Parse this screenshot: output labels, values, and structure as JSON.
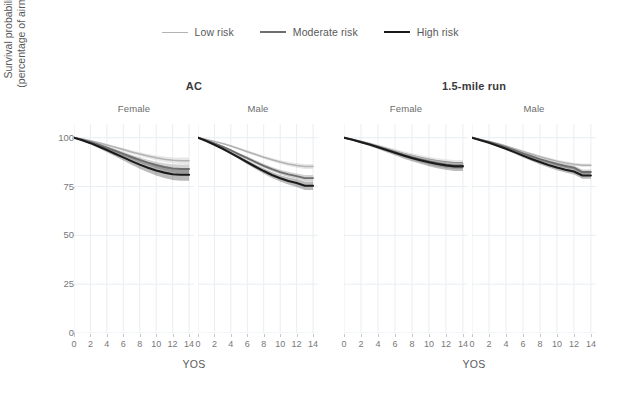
{
  "legend": {
    "position": "top-center",
    "items": [
      {
        "label": "Low risk",
        "color": "#b3b3b3",
        "width": 1.6
      },
      {
        "label": "Moderate risk",
        "color": "#6e6e6e",
        "width": 2.0
      },
      {
        "label": "High risk",
        "color": "#1a1a1a",
        "width": 2.2
      }
    ]
  },
  "axes": {
    "ylabel_line1": "Survival probability",
    "ylabel_line2": "(percentage of airmen)",
    "xlabel": "YOS",
    "yticks": [
      0,
      25,
      50,
      75,
      100
    ],
    "xticks": [
      0,
      2,
      4,
      6,
      8,
      10,
      12,
      14
    ],
    "ylim": [
      0,
      107
    ],
    "xlim": [
      0,
      14.6
    ],
    "grid": true,
    "grid_color": "#e9eef2"
  },
  "groups": {
    "super_titles": [
      "AC",
      "1.5-mile run"
    ],
    "facet_labels": [
      "Female",
      "Male",
      "Female",
      "Male"
    ]
  },
  "chart_data": {
    "type": "line",
    "title": "",
    "xlabel": "YOS",
    "ylabel": "Survival probability (percentage of airmen)",
    "xlim": [
      0,
      14.6
    ],
    "ylim": [
      0,
      107
    ],
    "xticks": [
      0,
      2,
      4,
      6,
      8,
      10,
      12,
      14
    ],
    "yticks": [
      0,
      25,
      50,
      75,
      100
    ],
    "grid": true,
    "legend_position": "top-center",
    "x": [
      0,
      1,
      2,
      3,
      4,
      5,
      6,
      7,
      8,
      9,
      10,
      11,
      12,
      13,
      14
    ],
    "panels": [
      {
        "super_title": "AC",
        "facet_label": "Female",
        "series": [
          {
            "name": "Low risk",
            "color": "#b3b3b3",
            "values": [
              100,
              99.3,
              98.4,
              97.4,
              96.3,
              95.1,
              93.9,
              92.7,
              91.6,
              90.6,
              89.7,
              89.0,
              88.4,
              88.2,
              88.2
            ],
            "ci_lower": [
              100,
              99.0,
              98.0,
              96.9,
              95.7,
              94.4,
              93.1,
              91.8,
              90.6,
              89.5,
              88.5,
              87.6,
              86.9,
              86.5,
              86.5
            ],
            "ci_upper": [
              100,
              99.6,
              98.8,
              97.9,
              96.9,
              95.8,
              94.7,
              93.6,
              92.6,
              91.7,
              90.9,
              90.4,
              89.9,
              89.9,
              89.9
            ]
          },
          {
            "name": "Moderate risk",
            "color": "#6e6e6e",
            "values": [
              100,
              99.0,
              97.8,
              96.4,
              94.9,
              93.3,
              91.7,
              90.1,
              88.6,
              87.2,
              86.0,
              85.0,
              84.3,
              84.0,
              84.0
            ],
            "ci_lower": [
              100,
              98.7,
              97.3,
              95.7,
              94.1,
              92.4,
              90.6,
              88.9,
              87.2,
              85.7,
              84.3,
              83.1,
              82.2,
              81.7,
              81.7
            ],
            "ci_upper": [
              100,
              99.3,
              98.3,
              97.1,
              95.7,
              94.2,
              92.8,
              91.3,
              90.0,
              88.7,
              87.7,
              86.9,
              86.4,
              86.3,
              86.3
            ]
          },
          {
            "name": "High risk",
            "color": "#1a1a1a",
            "values": [
              100,
              98.7,
              97.2,
              95.5,
              93.7,
              91.8,
              89.9,
              88.0,
              86.2,
              84.6,
              83.2,
              82.1,
              81.3,
              81.0,
              81.0
            ],
            "ci_lower": [
              100,
              98.3,
              96.6,
              94.6,
              92.6,
              90.5,
              88.3,
              86.2,
              84.1,
              82.3,
              80.6,
              79.3,
              78.3,
              77.9,
              77.9
            ],
            "ci_upper": [
              100,
              99.1,
              97.8,
              96.4,
              94.8,
              93.1,
              91.5,
              89.8,
              88.3,
              86.9,
              85.8,
              84.9,
              84.3,
              84.1,
              84.1
            ]
          }
        ]
      },
      {
        "super_title": "AC",
        "facet_label": "Male",
        "series": [
          {
            "name": "Low risk",
            "color": "#b3b3b3",
            "values": [
              100,
              99.1,
              98.1,
              97.0,
              95.7,
              94.3,
              92.8,
              91.4,
              90.0,
              88.7,
              87.5,
              86.5,
              85.7,
              85.2,
              85.2
            ],
            "ci_lower": [
              100,
              98.9,
              97.8,
              96.6,
              95.2,
              93.7,
              92.2,
              90.7,
              89.2,
              87.9,
              86.6,
              85.5,
              84.6,
              84.0,
              84.0
            ],
            "ci_upper": [
              100,
              99.3,
              98.4,
              97.4,
              96.2,
              94.9,
              93.5,
              92.1,
              90.8,
              89.6,
              88.5,
              87.6,
              86.9,
              86.5,
              86.5
            ]
          },
          {
            "name": "Moderate risk",
            "color": "#6e6e6e",
            "values": [
              100,
              98.6,
              97.1,
              95.4,
              93.5,
              91.5,
              89.5,
              87.5,
              85.6,
              83.9,
              82.4,
              81.2,
              80.3,
              79.3,
              79.3
            ],
            "ci_lower": [
              100,
              98.4,
              96.8,
              94.9,
              92.9,
              90.8,
              88.7,
              86.6,
              84.6,
              82.8,
              81.2,
              79.9,
              78.9,
              77.8,
              77.8
            ],
            "ci_upper": [
              100,
              98.9,
              97.5,
              95.9,
              94.1,
              92.2,
              90.3,
              88.4,
              86.6,
              85.0,
              83.6,
              82.5,
              81.7,
              80.9,
              80.9
            ]
          },
          {
            "name": "High risk",
            "color": "#1a1a1a",
            "values": [
              100,
              98.3,
              96.4,
              94.3,
              92.1,
              89.8,
              87.4,
              85.1,
              82.9,
              80.9,
              79.2,
              77.8,
              76.8,
              75.4,
              75.4
            ],
            "ci_lower": [
              100,
              98.0,
              96.0,
              93.8,
              91.4,
              88.9,
              86.4,
              83.9,
              81.5,
              79.4,
              77.5,
              76.0,
              74.8,
              73.2,
              73.2
            ],
            "ci_upper": [
              100,
              98.6,
              96.8,
              94.9,
              92.8,
              90.7,
              88.5,
              86.3,
              84.2,
              82.4,
              80.8,
              79.6,
              78.7,
              77.6,
              77.6
            ]
          }
        ]
      },
      {
        "super_title": "1.5-mile run",
        "facet_label": "Female",
        "series": [
          {
            "name": "Low risk",
            "color": "#b3b3b3",
            "values": [
              100,
              99.1,
              98.1,
              97.0,
              95.8,
              94.5,
              93.2,
              91.9,
              90.7,
              89.6,
              88.6,
              87.8,
              87.1,
              86.6,
              86.6
            ],
            "ci_lower": [
              100,
              98.8,
              97.7,
              96.4,
              95.0,
              93.6,
              92.1,
              90.7,
              89.3,
              88.1,
              87.0,
              86.1,
              85.3,
              84.7,
              84.7
            ],
            "ci_upper": [
              100,
              99.4,
              98.5,
              97.6,
              96.5,
              95.4,
              94.2,
              93.1,
              92.0,
              91.1,
              90.2,
              89.5,
              89.0,
              88.6,
              88.6
            ]
          },
          {
            "name": "Moderate risk",
            "color": "#6e6e6e",
            "values": [
              100,
              99.0,
              97.9,
              96.7,
              95.4,
              94.0,
              92.6,
              91.2,
              89.9,
              88.8,
              87.8,
              86.9,
              86.2,
              85.7,
              85.7
            ],
            "ci_lower": [
              100,
              98.7,
              97.5,
              96.2,
              94.7,
              93.2,
              91.6,
              90.1,
              88.7,
              87.4,
              86.3,
              85.3,
              84.5,
              83.9,
              83.9
            ],
            "ci_upper": [
              100,
              99.3,
              98.3,
              97.2,
              96.0,
              94.8,
              93.5,
              92.3,
              91.1,
              90.1,
              89.2,
              88.5,
              87.9,
              87.5,
              87.5
            ]
          },
          {
            "name": "High risk",
            "color": "#1a1a1a",
            "values": [
              100,
              98.9,
              97.7,
              96.5,
              95.1,
              93.7,
              92.3,
              90.9,
              89.6,
              88.4,
              87.4,
              86.5,
              85.8,
              85.3,
              85.3
            ],
            "ci_lower": [
              100,
              98.5,
              97.2,
              95.8,
              94.2,
              92.6,
              91.0,
              89.4,
              87.9,
              86.6,
              85.4,
              84.4,
              83.6,
              83.0,
              83.0
            ],
            "ci_upper": [
              100,
              99.2,
              98.2,
              97.1,
              95.9,
              94.7,
              93.5,
              92.3,
              91.2,
              90.2,
              89.3,
              88.6,
              88.0,
              87.6,
              87.6
            ]
          }
        ]
      },
      {
        "super_title": "1.5-mile run",
        "facet_label": "Male",
        "series": [
          {
            "name": "Low risk",
            "color": "#b3b3b3",
            "values": [
              100,
              99.1,
              98.1,
              97.0,
              95.7,
              94.4,
              93.0,
              91.6,
              90.3,
              89.1,
              88.0,
              87.1,
              86.4,
              85.9,
              85.9
            ],
            "ci_lower": [
              100,
              98.9,
              97.8,
              96.6,
              95.3,
              93.9,
              92.5,
              91.1,
              89.7,
              88.5,
              87.4,
              86.4,
              85.6,
              85.0,
              85.0
            ],
            "ci_upper": [
              100,
              99.3,
              98.4,
              97.4,
              96.1,
              94.9,
              93.6,
              92.2,
              91.0,
              89.8,
              88.7,
              87.9,
              87.2,
              86.8,
              86.8
            ]
          },
          {
            "name": "Moderate risk",
            "color": "#6e6e6e",
            "values": [
              100,
              98.9,
              97.8,
              96.5,
              95.1,
              93.6,
              92.0,
              90.5,
              89.0,
              87.7,
              86.5,
              85.5,
              84.7,
              82.4,
              82.4
            ],
            "ci_lower": [
              100,
              98.7,
              97.5,
              96.1,
              94.6,
              93.0,
              91.3,
              89.7,
              88.2,
              86.8,
              85.6,
              84.5,
              83.7,
              81.2,
              81.2
            ],
            "ci_upper": [
              100,
              99.1,
              98.1,
              96.9,
              95.6,
              94.2,
              92.7,
              91.3,
              89.9,
              88.6,
              87.5,
              86.6,
              85.8,
              83.7,
              83.7
            ]
          },
          {
            "name": "High risk",
            "color": "#1a1a1a",
            "values": [
              100,
              98.7,
              97.4,
              95.9,
              94.3,
              92.6,
              90.8,
              89.1,
              87.5,
              86.0,
              84.7,
              83.6,
              82.7,
              80.6,
              80.6
            ],
            "ci_lower": [
              100,
              98.5,
              97.0,
              95.4,
              93.6,
              91.8,
              89.9,
              88.0,
              86.3,
              84.7,
              83.3,
              82.2,
              81.2,
              79.0,
              79.0
            ],
            "ci_upper": [
              100,
              99.0,
              97.8,
              96.5,
              95.0,
              93.5,
              91.8,
              90.2,
              88.7,
              87.3,
              86.1,
              85.1,
              84.2,
              82.3,
              82.3
            ]
          }
        ]
      }
    ]
  }
}
